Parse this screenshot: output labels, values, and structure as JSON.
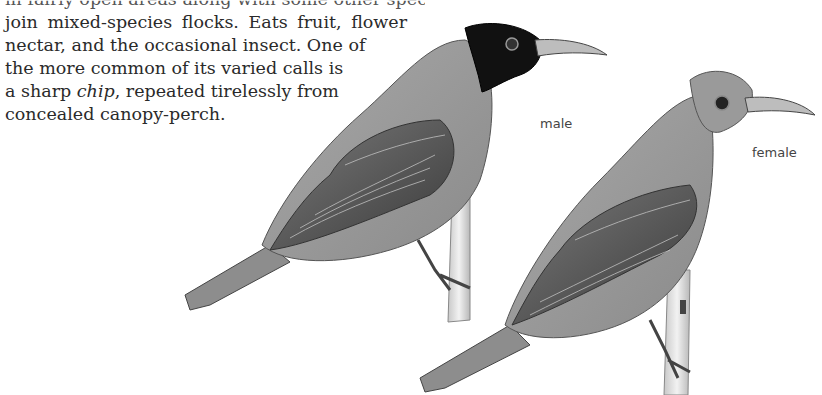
{
  "text": {
    "lines": [
      "in fairly open areas along with some other species; may",
      "join mixed-species flocks. Eats fruit, flower",
      "nectar, and the occasional insect. One of",
      "the more common of its varied calls is",
      "a sharp ",
      "concealed canopy-perch."
    ],
    "line5_italic": "chip",
    "line5_rest": ", repeated tirelessly from"
  },
  "illustrations": [
    {
      "label": "male",
      "description": "bird with black hood perched on branch"
    },
    {
      "label": "female",
      "description": "grey-headed bird perched on branch"
    }
  ],
  "colors": {
    "text": "#2a2a2a",
    "label": "#444444",
    "background": "#ffffff"
  }
}
